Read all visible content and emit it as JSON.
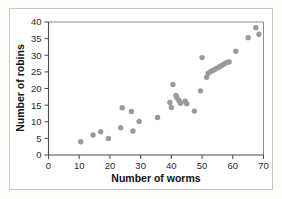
{
  "chart_data": {
    "type": "scatter",
    "title": "",
    "xlabel": "Number of worms",
    "ylabel": "Number of robins",
    "xlim": [
      0,
      70
    ],
    "ylim": [
      0,
      40
    ],
    "xticks": [
      0,
      10,
      20,
      30,
      40,
      50,
      60,
      70
    ],
    "yticks": [
      0,
      5,
      10,
      15,
      20,
      25,
      30,
      35,
      40
    ],
    "grid": false,
    "legend": null,
    "point_color": "#9a9a9a",
    "points": [
      {
        "x": 10.5,
        "y": 4.0
      },
      {
        "x": 14.5,
        "y": 6.0
      },
      {
        "x": 17.0,
        "y": 7.0
      },
      {
        "x": 19.5,
        "y": 5.0
      },
      {
        "x": 23.5,
        "y": 8.2
      },
      {
        "x": 24.0,
        "y": 14.2
      },
      {
        "x": 27.0,
        "y": 13.1
      },
      {
        "x": 27.5,
        "y": 7.2
      },
      {
        "x": 29.5,
        "y": 10.1
      },
      {
        "x": 35.5,
        "y": 11.3
      },
      {
        "x": 39.5,
        "y": 15.8
      },
      {
        "x": 40.0,
        "y": 14.3
      },
      {
        "x": 40.5,
        "y": 21.2
      },
      {
        "x": 41.5,
        "y": 17.9
      },
      {
        "x": 41.8,
        "y": 17.2
      },
      {
        "x": 42.5,
        "y": 16.4
      },
      {
        "x": 43.0,
        "y": 15.6
      },
      {
        "x": 44.5,
        "y": 16.2
      },
      {
        "x": 45.0,
        "y": 15.4
      },
      {
        "x": 47.5,
        "y": 13.2
      },
      {
        "x": 49.5,
        "y": 19.3
      },
      {
        "x": 50.0,
        "y": 29.3
      },
      {
        "x": 51.5,
        "y": 23.4
      },
      {
        "x": 52.0,
        "y": 24.6
      },
      {
        "x": 52.8,
        "y": 25.1
      },
      {
        "x": 53.5,
        "y": 25.4
      },
      {
        "x": 54.2,
        "y": 25.8
      },
      {
        "x": 55.0,
        "y": 26.2
      },
      {
        "x": 55.8,
        "y": 26.6
      },
      {
        "x": 56.5,
        "y": 27.0
      },
      {
        "x": 57.2,
        "y": 27.4
      },
      {
        "x": 58.0,
        "y": 27.8
      },
      {
        "x": 58.8,
        "y": 28.0
      },
      {
        "x": 61.0,
        "y": 31.2
      },
      {
        "x": 65.0,
        "y": 35.3
      },
      {
        "x": 67.5,
        "y": 38.3
      },
      {
        "x": 68.5,
        "y": 36.3
      }
    ]
  }
}
